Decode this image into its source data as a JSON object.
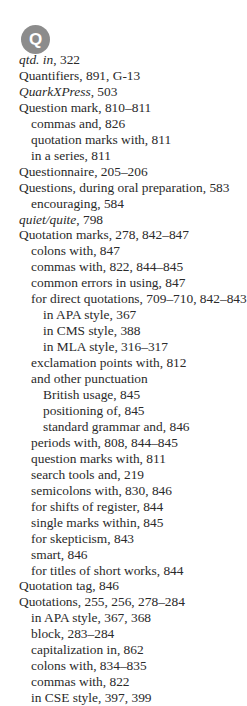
{
  "section": {
    "letter": "Q",
    "badge_color": "#8c8c8c"
  },
  "entries": [
    {
      "level": 0,
      "term": "qtd. in",
      "italic": true,
      "pages": ", 322"
    },
    {
      "level": 0,
      "term": "Quantifiers",
      "italic": false,
      "pages": ", 891, G-13"
    },
    {
      "level": 0,
      "term": "QuarkXPress",
      "italic": true,
      "pages": ", 503"
    },
    {
      "level": 0,
      "term": "Question mark",
      "italic": false,
      "pages": ", 810–811"
    },
    {
      "level": 1,
      "term": "commas and",
      "italic": false,
      "pages": ", 826"
    },
    {
      "level": 1,
      "term": "quotation marks with",
      "italic": false,
      "pages": ", 811"
    },
    {
      "level": 1,
      "term": "in a series",
      "italic": false,
      "pages": ", 811"
    },
    {
      "level": 0,
      "term": "Questionnaire",
      "italic": false,
      "pages": ", 205–206"
    },
    {
      "level": 0,
      "term": "Questions, during oral preparation",
      "italic": false,
      "pages": ", 583"
    },
    {
      "level": 1,
      "term": "encouraging",
      "italic": false,
      "pages": ", 584"
    },
    {
      "level": 0,
      "term": "quiet/quite",
      "italic": true,
      "pages": ", 798"
    },
    {
      "level": 0,
      "term": "Quotation marks",
      "italic": false,
      "pages": ", 278, 842–847"
    },
    {
      "level": 1,
      "term": "colons with",
      "italic": false,
      "pages": ", 847"
    },
    {
      "level": 1,
      "term": "commas with",
      "italic": false,
      "pages": ", 822, 844–845"
    },
    {
      "level": 1,
      "term": "common errors in using",
      "italic": false,
      "pages": ", 847"
    },
    {
      "level": 1,
      "term": "for direct quotations",
      "italic": false,
      "pages": ", 709–710, 842–843"
    },
    {
      "level": 2,
      "term": "in APA style",
      "italic": false,
      "pages": ", 367"
    },
    {
      "level": 2,
      "term": "in CMS style",
      "italic": false,
      "pages": ", 388"
    },
    {
      "level": 2,
      "term": "in MLA style",
      "italic": false,
      "pages": ", 316–317"
    },
    {
      "level": 1,
      "term": "exclamation points with",
      "italic": false,
      "pages": ", 812"
    },
    {
      "level": 1,
      "term": "and other punctuation",
      "italic": false,
      "pages": ""
    },
    {
      "level": 2,
      "term": "British usage",
      "italic": false,
      "pages": ", 845"
    },
    {
      "level": 2,
      "term": "positioning of",
      "italic": false,
      "pages": ", 845"
    },
    {
      "level": 2,
      "term": "standard grammar and",
      "italic": false,
      "pages": ", 846"
    },
    {
      "level": 1,
      "term": "periods with",
      "italic": false,
      "pages": ", 808, 844–845"
    },
    {
      "level": 1,
      "term": "question marks with",
      "italic": false,
      "pages": ", 811"
    },
    {
      "level": 1,
      "term": "search tools and",
      "italic": false,
      "pages": ", 219"
    },
    {
      "level": 1,
      "term": "semicolons with",
      "italic": false,
      "pages": ", 830, 846"
    },
    {
      "level": 1,
      "term": "for shifts of register",
      "italic": false,
      "pages": ", 844"
    },
    {
      "level": 1,
      "term": "single marks within",
      "italic": false,
      "pages": ", 845"
    },
    {
      "level": 1,
      "term": "for skepticism",
      "italic": false,
      "pages": ", 843"
    },
    {
      "level": 1,
      "term": "smart",
      "italic": false,
      "pages": ", 846"
    },
    {
      "level": 1,
      "term": "for titles of short works",
      "italic": false,
      "pages": ", 844"
    },
    {
      "level": 0,
      "term": "Quotation tag",
      "italic": false,
      "pages": ", 846"
    },
    {
      "level": 0,
      "term": "Quotations",
      "italic": false,
      "pages": ", 255, 256, 278–284"
    },
    {
      "level": 1,
      "term": "in APA style",
      "italic": false,
      "pages": ", 367, 368"
    },
    {
      "level": 1,
      "term": "block",
      "italic": false,
      "pages": ", 283–284"
    },
    {
      "level": 1,
      "term": "capitalization in",
      "italic": false,
      "pages": ", 862"
    },
    {
      "level": 1,
      "term": "colons with",
      "italic": false,
      "pages": ", 834–835"
    },
    {
      "level": 1,
      "term": "commas with",
      "italic": false,
      "pages": ", 822"
    },
    {
      "level": 1,
      "term": "in CSE style",
      "italic": false,
      "pages": ", 397, 399"
    }
  ]
}
